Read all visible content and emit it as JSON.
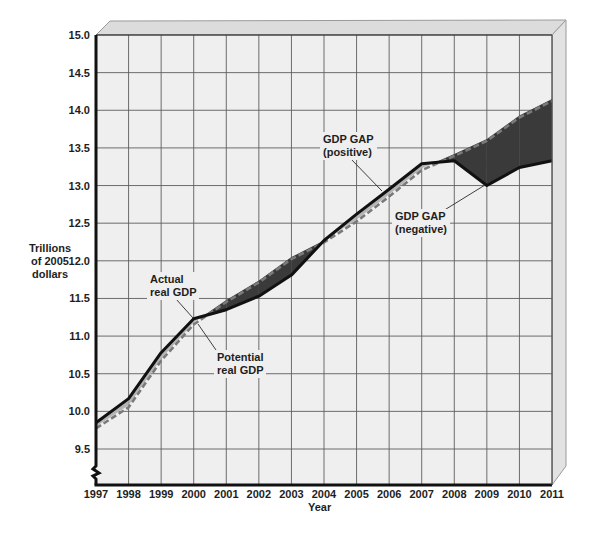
{
  "chart_data": {
    "type": "line",
    "title": "",
    "xlabel": "Year",
    "ylabel": "Trillions of 2005 dollars",
    "ylabel_lines": [
      "Trillions",
      "of 2005",
      "dollars"
    ],
    "categories": [
      "1997",
      "1998",
      "1999",
      "2000",
      "2001",
      "2002",
      "2003",
      "2004",
      "2005",
      "2006",
      "2007",
      "2008",
      "2009",
      "2010",
      "2011"
    ],
    "x": [
      1997,
      1998,
      1999,
      2000,
      2001,
      2002,
      2003,
      2004,
      2005,
      2006,
      2007,
      2008,
      2009,
      2010,
      2011
    ],
    "yticks": [
      9.5,
      10.0,
      10.5,
      11.0,
      11.5,
      12.0,
      12.5,
      13.0,
      13.5,
      14.0,
      14.5,
      15.0
    ],
    "ytick_labels": [
      "9.5",
      "10.0",
      "10.5",
      "11.0",
      "11.5",
      "12.0",
      "12.5",
      "13.0",
      "13.5",
      "14.0",
      "14.5",
      "15.0"
    ],
    "ylim": [
      9.0,
      15.0
    ],
    "y_axis_break": true,
    "grid": true,
    "legend": "none (direct annotations)",
    "series": [
      {
        "name": "Actual real GDP",
        "style": "solid",
        "color": "#111111",
        "values": [
          9.85,
          10.17,
          10.78,
          11.23,
          11.35,
          11.53,
          11.81,
          12.27,
          12.62,
          12.95,
          13.29,
          13.33,
          13.0,
          13.24,
          13.33
        ]
      },
      {
        "name": "Potential real GDP",
        "style": "dashed",
        "color": "#7a7a7a",
        "values": [
          9.8,
          10.08,
          10.7,
          11.18,
          11.48,
          11.74,
          12.05,
          12.27,
          12.55,
          12.88,
          13.23,
          13.42,
          13.62,
          13.93,
          14.15
        ]
      }
    ],
    "fills": {
      "positive_gap_color": "#b4b4b4",
      "negative_gap_color": "#3a3a3a"
    },
    "annotations": {
      "actual": [
        "Actual",
        "real GDP"
      ],
      "potential": [
        "Potential",
        "real GDP"
      ],
      "gap_positive": [
        "GDP GAP",
        "(positive)"
      ],
      "gap_negative": [
        "GDP GAP",
        "(negative)"
      ]
    }
  },
  "colors": {
    "plot_background": "#efefef",
    "grid": "#5e5e5e",
    "axis": "#111111",
    "frame_top": "#dcdcdc",
    "frame_side": "#e2e2e2",
    "frame_edge": "#9a9a9a"
  }
}
